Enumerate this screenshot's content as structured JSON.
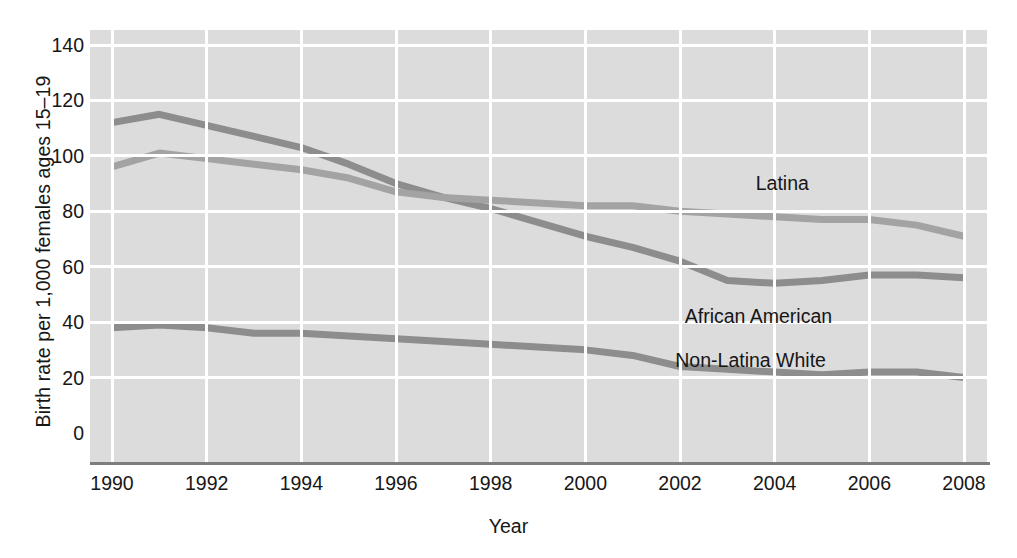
{
  "chart_data": {
    "type": "line",
    "title": "",
    "xlabel": "Year",
    "ylabel": "Birth rate per 1,000 females ages 15–19",
    "xlim": [
      1990,
      2008
    ],
    "ylim": [
      0,
      140
    ],
    "xticks": [
      "1990",
      "1992",
      "1994",
      "1996",
      "1998",
      "2000",
      "2002",
      "2004",
      "2006",
      "2008"
    ],
    "yticks": [
      "0",
      "20",
      "40",
      "60",
      "80",
      "100",
      "120",
      "140"
    ],
    "grid": "both, white lines on gray panel",
    "legend_position": "inline labels at right of each line",
    "x": [
      1990,
      1991,
      1992,
      1993,
      1994,
      1995,
      1996,
      1997,
      1998,
      1999,
      2000,
      2001,
      2002,
      2003,
      2004,
      2005,
      2006,
      2007,
      2008
    ],
    "series": [
      {
        "name": "African American",
        "color": "#8d8d8d",
        "label_x": 2002.1,
        "label_y": 42,
        "values": [
          112,
          115,
          111,
          107,
          103,
          97,
          90,
          85,
          81,
          76,
          71,
          67,
          62,
          55,
          54,
          55,
          57,
          57,
          56
        ]
      },
      {
        "name": "Latina",
        "color": "#a3a3a3",
        "label_x": 2003.6,
        "label_y": 90,
        "values": [
          96,
          101,
          99,
          97,
          95,
          92,
          87,
          85,
          84,
          83,
          82,
          82,
          80,
          79,
          78,
          77,
          77,
          75,
          71
        ]
      },
      {
        "name": "Non-Latina White",
        "color": "#8d8d8d",
        "label_x": 2001.9,
        "label_y": 26,
        "values": [
          38,
          39,
          38,
          36,
          36,
          35,
          34,
          33,
          32,
          31,
          30,
          28,
          24,
          23,
          22,
          21,
          22,
          22,
          20
        ]
      }
    ]
  },
  "colors": {
    "panel": "#dcdcdc",
    "grid": "#ffffff",
    "axis": "#7d7d7d",
    "text": "#161616"
  }
}
